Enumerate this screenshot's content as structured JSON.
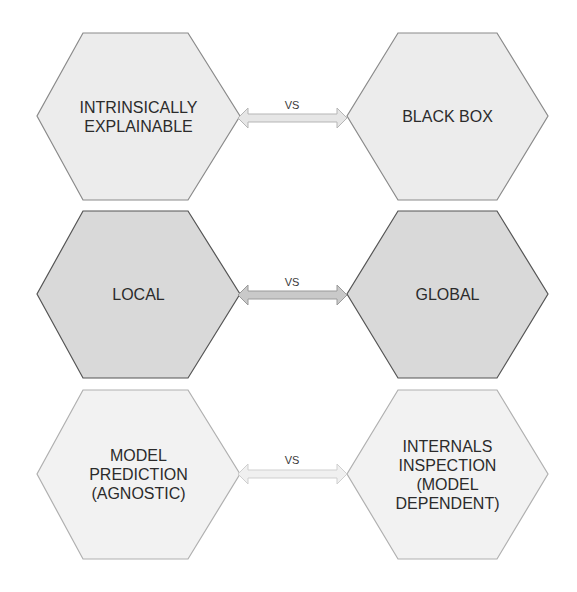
{
  "diagram": {
    "rows": [
      {
        "left": {
          "label": "INTRINSICALLY\nEXPLAINABLE"
        },
        "connector": {
          "label": "VS",
          "icon": "double-arrow-icon"
        },
        "right": {
          "label": "BLACK BOX"
        },
        "style": {
          "fill": "#ececec",
          "stroke": "#8a8a8a",
          "arrow_fill": "#e6e6e6",
          "arrow_stroke": "#b5b5b5"
        }
      },
      {
        "left": {
          "label": "LOCAL"
        },
        "connector": {
          "label": "VS",
          "icon": "double-arrow-icon"
        },
        "right": {
          "label": "GLOBAL"
        },
        "style": {
          "fill": "#d9d9d9",
          "stroke": "#555555",
          "arrow_fill": "#c9c9c9",
          "arrow_stroke": "#9a9a9a"
        }
      },
      {
        "left": {
          "label": "MODEL\nPREDICTION\n(AGNOSTIC)"
        },
        "connector": {
          "label": "VS",
          "icon": "double-arrow-icon"
        },
        "right": {
          "label": "INTERNALS\nINSPECTION\n(MODEL\nDEPENDENT)"
        },
        "style": {
          "fill": "#f2f2f2",
          "stroke": "#b0b0b0",
          "arrow_fill": "#f0f0f0",
          "arrow_stroke": "#cfcfcf"
        }
      }
    ]
  }
}
